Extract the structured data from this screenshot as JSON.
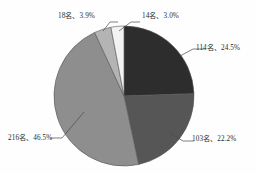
{
  "chart_data": {
    "type": "pie",
    "title": "",
    "subtitle": "",
    "xlabel": "",
    "ylabel": "",
    "legend_position": "none",
    "grid": false,
    "total_count": 465,
    "unit_suffix": "名",
    "start_angle_deg": 0,
    "direction": "clockwise",
    "labels": [
      "114名、24.5%",
      "103名、22.2%",
      "216名、46.5%",
      "18名、3.9%",
      "14名、3.0%"
    ],
    "categories": [
      "114名",
      "103名",
      "216名",
      "18名",
      "14名"
    ],
    "values": [
      114,
      103,
      216,
      18,
      14
    ],
    "percentages": [
      24.5,
      22.2,
      46.5,
      3.9,
      3.0
    ],
    "colors": [
      "#2d2d2d",
      "#565656",
      "#8e8e8e",
      "#b4b4b4",
      "#f2f2f2"
    ],
    "slice_border_color": "#555555",
    "leader_line_color": "#4a4a4a",
    "slices": [
      {
        "label": "114名、24.5%",
        "count": 114,
        "percent": 24.5,
        "color": "#2d2d2d"
      },
      {
        "label": "103名、22.2%",
        "count": 103,
        "percent": 22.2,
        "color": "#565656"
      },
      {
        "label": "216名、46.5%",
        "count": 216,
        "percent": 46.5,
        "color": "#8e8e8e"
      },
      {
        "label": "18名、3.9%",
        "count": 18,
        "percent": 3.9,
        "color": "#b4b4b4"
      },
      {
        "label": "14名、3.0%",
        "count": 14,
        "percent": 3.0,
        "color": "#f2f2f2"
      }
    ]
  },
  "labels": {
    "top_left": "18名、3.9%",
    "top_right": "14名、3.0%",
    "right": "114名、24.5%",
    "bottom_right": "103名、22.2%",
    "bottom_left": "216名、46.5%"
  }
}
